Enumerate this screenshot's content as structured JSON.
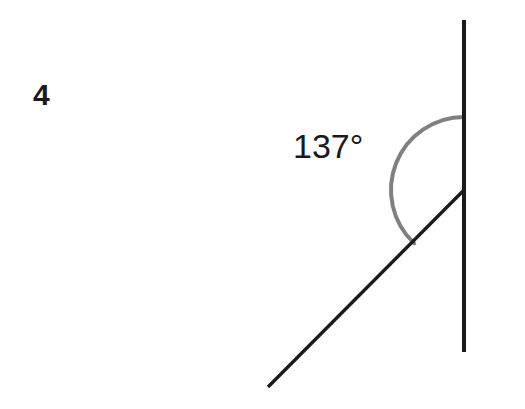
{
  "page": {
    "width": 525,
    "height": 409,
    "background_color": "#ffffff"
  },
  "problem": {
    "number": "4"
  },
  "figure": {
    "type": "geometry-angle-diagram",
    "angle_label": "137°",
    "colors": {
      "line": "#1a1a1a",
      "arc": "#808080",
      "text": "#1a1a1a"
    },
    "vertical_line": {
      "name": "vertical-ray-line",
      "x1": 464,
      "y1": 20,
      "x2": 464,
      "y2": 352,
      "stroke_width": 4
    },
    "diagonal_line": {
      "name": "diagonal-ray-line",
      "x1": 268,
      "y1": 387,
      "x2": 464,
      "y2": 190,
      "stroke_width": 3.4
    },
    "vertex": {
      "x": 464,
      "y": 190
    },
    "arc": {
      "name": "angle-arc",
      "center_x": 464,
      "center_y": 190,
      "radius": 73,
      "start_angle_deg": -90,
      "sweep_deg": 137,
      "stroke_width": 4
    }
  },
  "chart_data": {
    "type": "diagram",
    "title": "",
    "annotations": [
      "4",
      "137°"
    ],
    "measured_angle_degrees": 137,
    "elements": [
      {
        "kind": "line",
        "role": "vertical",
        "from": [
          464,
          20
        ],
        "to": [
          464,
          352
        ]
      },
      {
        "kind": "line",
        "role": "diagonal",
        "from": [
          268,
          387
        ],
        "to": [
          464,
          190
        ]
      },
      {
        "kind": "arc",
        "role": "angle-marker",
        "center": [
          464,
          190
        ],
        "radius": 73,
        "start_deg": -90,
        "sweep_deg": 137
      }
    ]
  }
}
